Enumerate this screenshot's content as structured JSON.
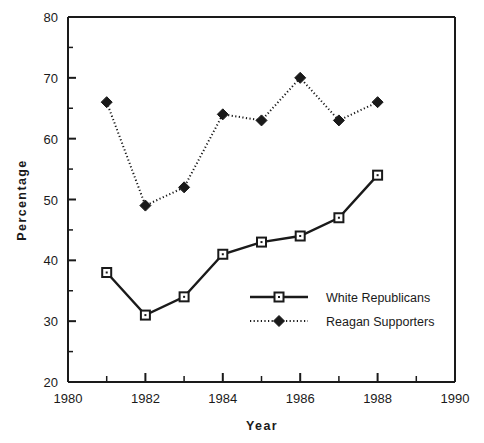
{
  "chart_data": {
    "type": "line",
    "title": "",
    "xlabel": "Year",
    "ylabel": "Percentage",
    "xlim": [
      1980,
      1990
    ],
    "ylim": [
      20,
      80
    ],
    "grid": false,
    "legend_position": "inside-lower-right",
    "x_ticks_major": [
      1980,
      1982,
      1984,
      1986,
      1988,
      1990
    ],
    "x_ticks_minor": [
      1981,
      1983,
      1985,
      1987,
      1989
    ],
    "x_tick_labels": [
      "1980",
      "1982",
      "1984",
      "1986",
      "1988",
      "1990"
    ],
    "y_ticks_major": [
      20,
      30,
      40,
      50,
      60,
      70,
      80
    ],
    "y_ticks_minor": [
      25,
      35,
      45,
      55,
      65,
      75
    ],
    "y_tick_labels": [
      "20",
      "30",
      "40",
      "50",
      "60",
      "70",
      "80"
    ],
    "x": [
      1981,
      1982,
      1983,
      1984,
      1985,
      1986,
      1987,
      1988
    ],
    "series": [
      {
        "name": "White Republicans",
        "marker": "square",
        "line_style": "solid",
        "color": "#1a1a1a",
        "values": [
          38,
          31,
          34,
          41,
          43,
          44,
          47,
          54
        ]
      },
      {
        "name": "Reagan Supporters",
        "marker": "diamond",
        "line_style": "dotted",
        "color": "#1a1a1a",
        "values": [
          66,
          49,
          52,
          64,
          63,
          70,
          63,
          66
        ]
      }
    ]
  },
  "axes": {
    "y_title": "Percentage",
    "x_title": "Year"
  },
  "legend": {
    "entries": [
      {
        "label": "White Republicans",
        "marker": "square-marker",
        "style": "solid-line"
      },
      {
        "label": "Reagan Supporters",
        "marker": "diamond-marker",
        "style": "dotted-line"
      }
    ]
  },
  "colors": {
    "ink": "#1a1a1a",
    "background": "#ffffff",
    "marker_fill": "#ffffff"
  }
}
